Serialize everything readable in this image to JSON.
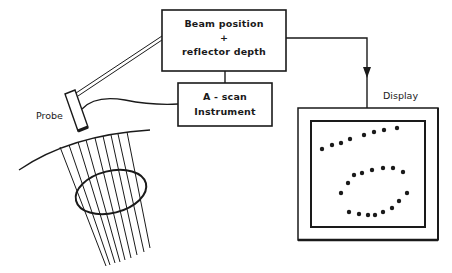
{
  "diagram": {
    "blocks": {
      "beam_position": {
        "line1": "Beam position",
        "line2": "+",
        "line3": "reflector depth"
      },
      "ascan": {
        "line1": "A - scan",
        "line2": "Instrument"
      },
      "display": {
        "label": "Display"
      },
      "probe": {
        "label": "Probe"
      }
    },
    "connections": [
      {
        "from": "probe",
        "to": "beam_position",
        "style": "double-line"
      },
      {
        "from": "probe",
        "to": "ascan",
        "style": "cable"
      },
      {
        "from": "ascan",
        "to": "beam_position",
        "style": "line"
      },
      {
        "from": "beam_position",
        "to": "display",
        "style": "arrow"
      }
    ],
    "beam": {
      "line_count": 9,
      "reflector_shape": "ellipse"
    },
    "display_dots": {
      "top_row": [
        [
          322,
          149
        ],
        [
          332,
          145
        ],
        [
          341,
          143
        ],
        [
          350,
          139
        ],
        [
          364,
          135
        ],
        [
          374,
          132
        ],
        [
          384,
          130
        ],
        [
          397,
          128
        ]
      ],
      "upper_arc": [
        [
          341,
          193
        ],
        [
          348,
          183
        ],
        [
          354,
          175
        ],
        [
          362,
          173
        ],
        [
          372,
          170
        ],
        [
          383,
          168
        ],
        [
          393,
          168
        ],
        [
          403,
          172
        ]
      ],
      "right": [
        [
          407,
          193
        ]
      ],
      "lower_arc": [
        [
          349,
          212
        ],
        [
          359,
          214
        ],
        [
          368,
          215
        ],
        [
          375,
          215
        ],
        [
          383,
          212
        ],
        [
          392,
          208
        ],
        [
          399,
          201
        ]
      ]
    },
    "colors": {
      "ink": "#1a1a1a",
      "background": "#ffffff"
    }
  }
}
